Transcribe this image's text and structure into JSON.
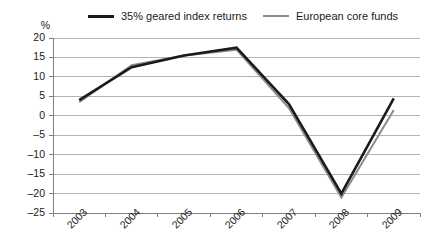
{
  "chart_data": {
    "type": "line",
    "title": "",
    "xlabel": "",
    "ylabel": "%",
    "categories": [
      "2003",
      "2004",
      "2005",
      "2006",
      "2007",
      "2008",
      "2009"
    ],
    "series": [
      {
        "name": "35% geared index returns",
        "color": "#1a1a1a",
        "line_width": 2.6,
        "values": [
          4,
          12.5,
          15.5,
          17.5,
          3,
          -20,
          4.5
        ]
      },
      {
        "name": "European core funds",
        "color": "#8c8c8c",
        "line_width": 2.0,
        "values": [
          3.5,
          13,
          15.5,
          17,
          2,
          -21,
          1.5
        ]
      }
    ],
    "ylim": [
      -25,
      20
    ],
    "yticks": [
      20,
      15,
      10,
      5,
      0,
      -5,
      -10,
      -15,
      -20,
      -25
    ],
    "ytick_labels": [
      "20",
      "15",
      "10",
      "5",
      "0",
      "–5",
      "–10",
      "–15",
      "–20",
      "–25"
    ],
    "grid": true,
    "grid_axis": "y",
    "grid_color": "#b3b3b3",
    "axis_color": "#808080",
    "legend_position": "top",
    "background": "#ffffff"
  },
  "legend": {
    "entries": [
      {
        "label": "35% geared index returns"
      },
      {
        "label": "European core funds"
      }
    ]
  },
  "axes": {
    "y_unit": "%"
  }
}
